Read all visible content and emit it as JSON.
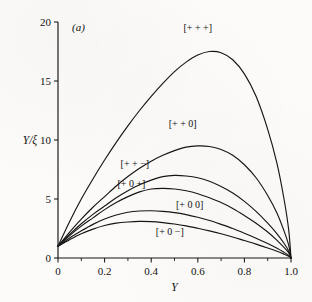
{
  "figure": {
    "panel_label": "(a)",
    "background_color": "#fcfbf9",
    "ink_color": "#161616"
  },
  "chart_data": {
    "type": "line",
    "title": "",
    "panel": "(a)",
    "xlabel": "Y",
    "ylabel": "Y/ξ",
    "xlim": [
      0,
      1.0
    ],
    "ylim": [
      0,
      20
    ],
    "grid": false,
    "legend": "inline-curve-labels",
    "x_ticks": [
      0,
      0.2,
      0.4,
      0.6,
      0.8,
      1.0
    ],
    "x_tick_labels": [
      "0",
      "0.2",
      "0.4",
      "0.6",
      "0.8",
      "1.0"
    ],
    "x_minor_ticks": [
      0.1,
      0.3,
      0.5,
      0.7,
      0.9
    ],
    "y_ticks": [
      0,
      5,
      10,
      15,
      20
    ],
    "y_tick_labels": [
      "0",
      "5",
      "10",
      "15",
      "20"
    ],
    "series": [
      {
        "name": "[+ + +]",
        "label": "[+ + +]",
        "peak_x": 0.65,
        "peak_y": 17.5,
        "x": [
          0.0,
          0.05,
          0.1,
          0.15,
          0.2,
          0.25,
          0.3,
          0.35,
          0.4,
          0.45,
          0.5,
          0.55,
          0.6,
          0.65,
          0.7,
          0.75,
          0.8,
          0.85,
          0.9,
          0.94,
          0.97,
          0.99,
          1.0
        ],
        "y": [
          1.0,
          3.1,
          5.0,
          6.7,
          8.3,
          9.8,
          11.2,
          12.5,
          13.7,
          14.8,
          15.8,
          16.6,
          17.2,
          17.5,
          17.4,
          16.8,
          15.6,
          13.7,
          10.9,
          8.0,
          5.0,
          2.4,
          0.0
        ]
      },
      {
        "name": "[+ + 0]",
        "label": "[+ + 0]",
        "peak_x": 0.6,
        "peak_y": 9.5,
        "x": [
          0.0,
          0.05,
          0.1,
          0.15,
          0.2,
          0.25,
          0.3,
          0.35,
          0.4,
          0.45,
          0.5,
          0.55,
          0.6,
          0.65,
          0.7,
          0.75,
          0.8,
          0.85,
          0.9,
          0.94,
          0.97,
          0.99,
          1.0
        ],
        "y": [
          1.0,
          2.2,
          3.3,
          4.3,
          5.2,
          6.1,
          6.9,
          7.6,
          8.2,
          8.7,
          9.1,
          9.4,
          9.5,
          9.45,
          9.2,
          8.7,
          7.9,
          6.8,
          5.3,
          3.8,
          2.3,
          1.1,
          0.0
        ]
      },
      {
        "name": "[+ + -]",
        "label": "[+ + −]",
        "peak_x": 0.5,
        "peak_y": 7.0,
        "x": [
          0.0,
          0.05,
          0.1,
          0.15,
          0.2,
          0.25,
          0.3,
          0.35,
          0.4,
          0.45,
          0.5,
          0.55,
          0.6,
          0.65,
          0.7,
          0.75,
          0.8,
          0.85,
          0.9,
          0.94,
          0.97,
          0.99,
          1.0
        ],
        "y": [
          1.0,
          2.0,
          2.9,
          3.7,
          4.4,
          5.1,
          5.7,
          6.2,
          6.6,
          6.9,
          7.0,
          6.95,
          6.8,
          6.5,
          6.05,
          5.5,
          4.8,
          3.95,
          2.95,
          2.05,
          1.25,
          0.6,
          0.0
        ]
      },
      {
        "name": "[+ 0 +]",
        "label": "[+ 0 +]",
        "peak_x": 0.45,
        "peak_y": 5.9,
        "x": [
          0.0,
          0.05,
          0.1,
          0.15,
          0.2,
          0.25,
          0.3,
          0.35,
          0.4,
          0.45,
          0.5,
          0.55,
          0.6,
          0.65,
          0.7,
          0.75,
          0.8,
          0.85,
          0.9,
          0.94,
          0.97,
          0.99,
          1.0
        ],
        "y": [
          1.0,
          1.9,
          2.7,
          3.4,
          4.1,
          4.7,
          5.2,
          5.6,
          5.85,
          5.9,
          5.85,
          5.7,
          5.45,
          5.1,
          4.7,
          4.2,
          3.6,
          2.95,
          2.2,
          1.5,
          0.9,
          0.45,
          0.0
        ]
      },
      {
        "name": "[+ 0 0]",
        "label": "[+ 0 0]",
        "peak_x": 0.4,
        "peak_y": 4.0,
        "x": [
          0.0,
          0.05,
          0.1,
          0.15,
          0.2,
          0.25,
          0.3,
          0.35,
          0.4,
          0.45,
          0.5,
          0.55,
          0.6,
          0.65,
          0.7,
          0.75,
          0.8,
          0.85,
          0.9,
          0.94,
          0.97,
          0.99,
          1.0
        ],
        "y": [
          1.0,
          1.7,
          2.3,
          2.85,
          3.3,
          3.65,
          3.88,
          3.98,
          4.0,
          3.95,
          3.85,
          3.68,
          3.45,
          3.18,
          2.85,
          2.5,
          2.1,
          1.68,
          1.22,
          0.82,
          0.48,
          0.22,
          0.0
        ]
      },
      {
        "name": "[+ 0 -]",
        "label": "[+ 0 −]",
        "peak_x": 0.38,
        "peak_y": 3.1,
        "x": [
          0.0,
          0.05,
          0.1,
          0.15,
          0.2,
          0.25,
          0.3,
          0.35,
          0.4,
          0.45,
          0.5,
          0.55,
          0.6,
          0.65,
          0.7,
          0.75,
          0.8,
          0.85,
          0.9,
          0.94,
          0.97,
          0.99,
          1.0
        ],
        "y": [
          1.0,
          1.55,
          2.05,
          2.45,
          2.75,
          2.95,
          3.05,
          3.1,
          3.08,
          3.0,
          2.88,
          2.72,
          2.52,
          2.3,
          2.05,
          1.78,
          1.48,
          1.18,
          0.85,
          0.57,
          0.33,
          0.15,
          0.0
        ]
      }
    ],
    "curve_label_positions": [
      {
        "label": "[+ + +]",
        "x": 0.6,
        "y": 19.2
      },
      {
        "label": "[+ + 0]",
        "x": 0.535,
        "y": 11.1
      },
      {
        "label": "[+ + −]",
        "x": 0.33,
        "y": 7.7
      },
      {
        "label": "[+ 0 +]",
        "x": 0.315,
        "y": 6.05
      },
      {
        "label": "[+ 0 0]",
        "x": 0.565,
        "y": 4.25
      },
      {
        "label": "[+ 0 −]",
        "x": 0.48,
        "y": 1.95
      }
    ]
  }
}
